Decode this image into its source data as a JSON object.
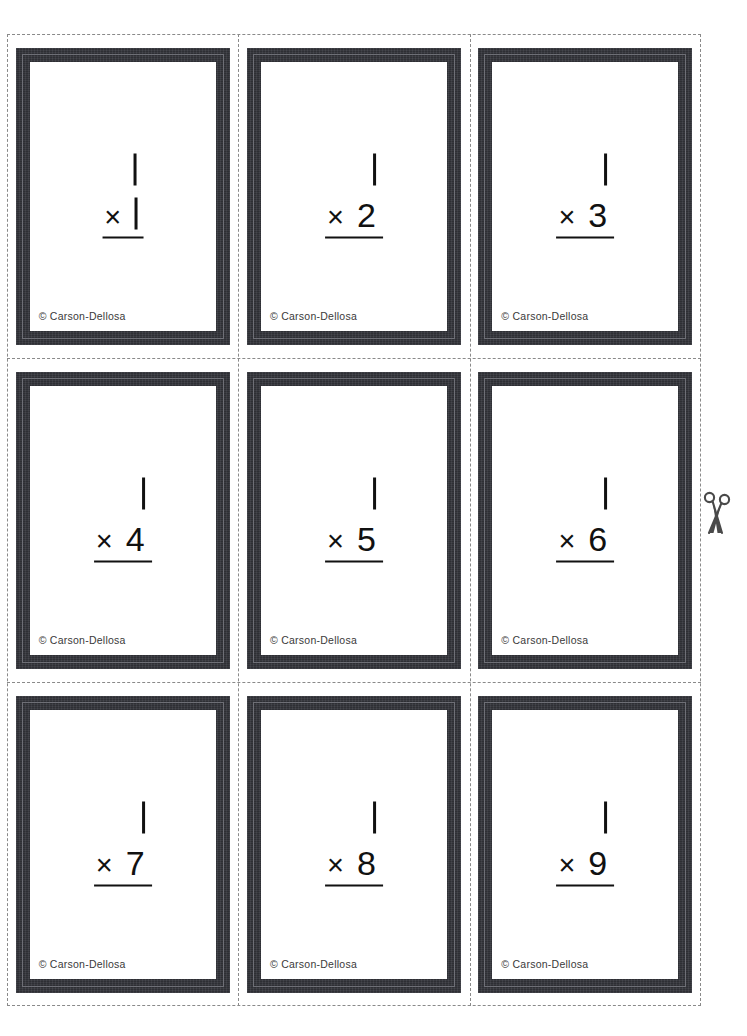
{
  "document": {
    "title": "Multiplication Flash Cards",
    "publisher": "Carson-Dellosa",
    "copyright_text": "© Carson-Dellosa",
    "page_background": "#ffffff",
    "frame_color": "#33343a",
    "ink_color": "#111111",
    "cut_line_color": "#8a8a8a"
  },
  "cut_guide": {
    "name": "dashed-cut-grid",
    "rows": 3,
    "columns": 3,
    "scissors_icon": "scissors-icon",
    "scissors_position": "right-edge-middle-row"
  },
  "cards": [
    {
      "id": "card-1",
      "multiplicand": "1",
      "operator": "×",
      "multiplier": "1",
      "multiplier_is_stroke_one": true,
      "expression": "1 × 1",
      "credit": "© Carson-Dellosa"
    },
    {
      "id": "card-2",
      "multiplicand": "1",
      "operator": "×",
      "multiplier": "2",
      "multiplier_is_stroke_one": false,
      "expression": "1 × 2",
      "credit": "© Carson-Dellosa"
    },
    {
      "id": "card-3",
      "multiplicand": "1",
      "operator": "×",
      "multiplier": "3",
      "multiplier_is_stroke_one": false,
      "expression": "1 × 3",
      "credit": "© Carson-Dellosa"
    },
    {
      "id": "card-4",
      "multiplicand": "1",
      "operator": "×",
      "multiplier": "4",
      "multiplier_is_stroke_one": false,
      "expression": "1 × 4",
      "credit": "© Carson-Dellosa"
    },
    {
      "id": "card-5",
      "multiplicand": "1",
      "operator": "×",
      "multiplier": "5",
      "multiplier_is_stroke_one": false,
      "expression": "1 × 5",
      "credit": "© Carson-Dellosa"
    },
    {
      "id": "card-6",
      "multiplicand": "1",
      "operator": "×",
      "multiplier": "6",
      "multiplier_is_stroke_one": false,
      "expression": "1 × 6",
      "credit": "© Carson-Dellosa"
    },
    {
      "id": "card-7",
      "multiplicand": "1",
      "operator": "×",
      "multiplier": "7",
      "multiplier_is_stroke_one": false,
      "expression": "1 × 7",
      "credit": "© Carson-Dellosa"
    },
    {
      "id": "card-8",
      "multiplicand": "1",
      "operator": "×",
      "multiplier": "8",
      "multiplier_is_stroke_one": false,
      "expression": "1 × 8",
      "credit": "© Carson-Dellosa"
    },
    {
      "id": "card-9",
      "multiplicand": "1",
      "operator": "×",
      "multiplier": "9",
      "multiplier_is_stroke_one": false,
      "expression": "1 × 9",
      "credit": "© Carson-Dellosa"
    }
  ]
}
